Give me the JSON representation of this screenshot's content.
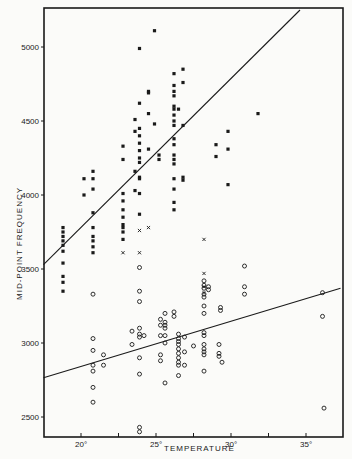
{
  "chart_data": {
    "type": "scatter",
    "title": "",
    "xlabel": "TEMPERATURE",
    "ylabel": "MID-POINT FREQUENCY",
    "xlim": [
      17.5,
      37.5
    ],
    "ylim": [
      2360,
      5250
    ],
    "x_ticks": [
      20,
      22.5,
      25,
      27.5,
      30,
      32.5,
      35
    ],
    "x_tick_labels": [
      "20°",
      "",
      "25°",
      "",
      "30°",
      "",
      "35°"
    ],
    "y_ticks": [
      2500,
      3000,
      3500,
      4000,
      4500,
      5000
    ],
    "y_tick_labels": [
      "2500",
      "3000",
      "3500",
      "4000",
      "4500",
      "5000"
    ],
    "grid": false,
    "legend": null,
    "series": [
      {
        "name": "filled squares (upper group)",
        "marker": "square-filled",
        "points": [
          [
            18.8,
            3780
          ],
          [
            18.8,
            3750
          ],
          [
            18.8,
            3720
          ],
          [
            18.8,
            3690
          ],
          [
            18.8,
            3660
          ],
          [
            18.8,
            3620
          ],
          [
            18.8,
            3540
          ],
          [
            18.8,
            3450
          ],
          [
            18.8,
            3410
          ],
          [
            18.8,
            3350
          ],
          [
            20.8,
            4160
          ],
          [
            20.8,
            4110
          ],
          [
            20.8,
            4040
          ],
          [
            20.8,
            3880
          ],
          [
            20.8,
            3780
          ],
          [
            20.8,
            3720
          ],
          [
            20.8,
            3690
          ],
          [
            20.8,
            3650
          ],
          [
            20.8,
            3610
          ],
          [
            20.2,
            4110
          ],
          [
            20.2,
            4000
          ],
          [
            22.8,
            4330
          ],
          [
            22.8,
            4240
          ],
          [
            22.8,
            4010
          ],
          [
            22.8,
            3960
          ],
          [
            22.8,
            3900
          ],
          [
            22.8,
            3850
          ],
          [
            22.8,
            3800
          ],
          [
            22.8,
            3780
          ],
          [
            22.8,
            3750
          ],
          [
            22.8,
            3700
          ],
          [
            23.6,
            4510
          ],
          [
            23.6,
            4430
          ],
          [
            23.6,
            4160
          ],
          [
            23.6,
            4030
          ],
          [
            23.9,
            4990
          ],
          [
            23.9,
            4620
          ],
          [
            23.9,
            4450
          ],
          [
            23.9,
            4400
          ],
          [
            23.9,
            4350
          ],
          [
            23.9,
            4300
          ],
          [
            23.9,
            4250
          ],
          [
            23.9,
            4220
          ],
          [
            23.9,
            4120
          ],
          [
            23.9,
            4110
          ],
          [
            23.9,
            4010
          ],
          [
            23.9,
            3870
          ],
          [
            24.5,
            4700
          ],
          [
            24.5,
            4690
          ],
          [
            24.5,
            4550
          ],
          [
            24.5,
            4310
          ],
          [
            24.9,
            5110
          ],
          [
            24.9,
            4480
          ],
          [
            25.2,
            4270
          ],
          [
            25.2,
            4240
          ],
          [
            26.2,
            4820
          ],
          [
            26.2,
            4740
          ],
          [
            26.2,
            4700
          ],
          [
            26.2,
            4670
          ],
          [
            26.2,
            4600
          ],
          [
            26.2,
            4580
          ],
          [
            26.2,
            4540
          ],
          [
            26.2,
            4500
          ],
          [
            26.2,
            4470
          ],
          [
            26.2,
            4380
          ],
          [
            26.2,
            4340
          ],
          [
            26.2,
            4270
          ],
          [
            26.2,
            4240
          ],
          [
            26.2,
            4210
          ],
          [
            26.2,
            4110
          ],
          [
            26.2,
            4040
          ],
          [
            26.2,
            3950
          ],
          [
            26.2,
            3900
          ],
          [
            26.5,
            4580
          ],
          [
            26.8,
            4850
          ],
          [
            26.8,
            4760
          ],
          [
            26.8,
            4470
          ],
          [
            26.8,
            4120
          ],
          [
            26.8,
            4100
          ],
          [
            29.0,
            4340
          ],
          [
            29.0,
            4260
          ],
          [
            29.8,
            4430
          ],
          [
            29.8,
            4310
          ],
          [
            29.8,
            4070
          ],
          [
            31.8,
            4550
          ]
        ]
      },
      {
        "name": "crosses",
        "marker": "x",
        "points": [
          [
            22.8,
            3610
          ],
          [
            23.9,
            3610
          ],
          [
            23.9,
            3760
          ],
          [
            24.5,
            3780
          ],
          [
            28.2,
            3700
          ],
          [
            28.2,
            3470
          ],
          [
            28.2,
            3380
          ],
          [
            28.2,
            3340
          ]
        ]
      },
      {
        "name": "open circles (lower group)",
        "marker": "circle-open",
        "points": [
          [
            20.8,
            3330
          ],
          [
            20.8,
            3030
          ],
          [
            20.8,
            2950
          ],
          [
            20.8,
            2850
          ],
          [
            20.8,
            2810
          ],
          [
            20.8,
            2700
          ],
          [
            20.8,
            2600
          ],
          [
            21.5,
            2920
          ],
          [
            21.5,
            2850
          ],
          [
            23.4,
            3080
          ],
          [
            23.4,
            2990
          ],
          [
            23.9,
            3510
          ],
          [
            23.9,
            3350
          ],
          [
            23.9,
            3280
          ],
          [
            23.9,
            3100
          ],
          [
            23.9,
            3060
          ],
          [
            23.9,
            3040
          ],
          [
            23.9,
            2900
          ],
          [
            23.9,
            2790
          ],
          [
            23.9,
            2430
          ],
          [
            23.9,
            2400
          ],
          [
            24.2,
            3050
          ],
          [
            25.3,
            3160
          ],
          [
            25.3,
            3120
          ],
          [
            25.3,
            3050
          ],
          [
            25.3,
            2920
          ],
          [
            25.3,
            2880
          ],
          [
            25.6,
            3200
          ],
          [
            25.6,
            3140
          ],
          [
            25.6,
            3120
          ],
          [
            25.6,
            3100
          ],
          [
            25.6,
            3050
          ],
          [
            25.6,
            3000
          ],
          [
            25.6,
            2730
          ],
          [
            26.2,
            3210
          ],
          [
            26.2,
            3180
          ],
          [
            26.5,
            3060
          ],
          [
            26.5,
            3030
          ],
          [
            26.5,
            3010
          ],
          [
            26.5,
            2990
          ],
          [
            26.5,
            2960
          ],
          [
            26.5,
            2930
          ],
          [
            26.5,
            2900
          ],
          [
            26.5,
            2870
          ],
          [
            26.5,
            2850
          ],
          [
            26.5,
            2780
          ],
          [
            26.9,
            3040
          ],
          [
            26.9,
            2940
          ],
          [
            26.9,
            2850
          ],
          [
            27.5,
            2980
          ],
          [
            28.2,
            3420
          ],
          [
            28.2,
            3390
          ],
          [
            28.2,
            3370
          ],
          [
            28.2,
            3330
          ],
          [
            28.2,
            3310
          ],
          [
            28.2,
            3250
          ],
          [
            28.2,
            3200
          ],
          [
            28.2,
            3070
          ],
          [
            28.2,
            3050
          ],
          [
            28.2,
            2990
          ],
          [
            28.2,
            2960
          ],
          [
            28.2,
            2940
          ],
          [
            28.2,
            2920
          ],
          [
            28.2,
            2810
          ],
          [
            28.5,
            3380
          ],
          [
            28.5,
            3360
          ],
          [
            29.2,
            2990
          ],
          [
            29.2,
            2930
          ],
          [
            29.2,
            2910
          ],
          [
            29.3,
            3240
          ],
          [
            29.3,
            3220
          ],
          [
            30.9,
            3520
          ],
          [
            30.9,
            3380
          ],
          [
            30.9,
            3330
          ],
          [
            29.4,
            2870
          ],
          [
            36.1,
            3340
          ],
          [
            36.1,
            3180
          ],
          [
            36.2,
            2560
          ]
        ]
      }
    ],
    "regression_lines": [
      {
        "name": "upper fit (filled squares)",
        "from": [
          17.5,
          3530
        ],
        "to": [
          34.6,
          5250
        ]
      },
      {
        "name": "lower fit (open circles)",
        "from": [
          17.5,
          2765
        ],
        "to": [
          37.3,
          3370
        ]
      }
    ],
    "style": {
      "ink": "#1a1a1a",
      "paper": "#fbfbf9"
    }
  }
}
